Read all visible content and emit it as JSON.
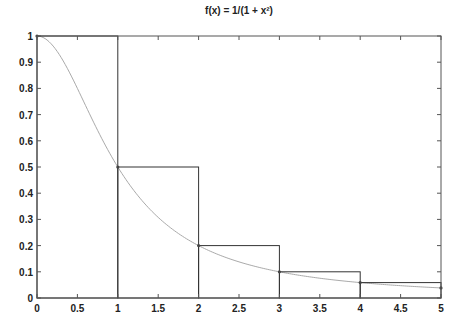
{
  "chart_data": {
    "type": "line",
    "title": "f(x) = 1/(1 + x²)",
    "xlabel": "",
    "ylabel": "",
    "xlim": [
      0,
      5
    ],
    "ylim": [
      0,
      1
    ],
    "grid": false,
    "legend": null,
    "x_ticks": [
      0,
      0.5,
      1,
      1.5,
      2,
      2.5,
      3,
      3.5,
      4,
      4.5,
      5
    ],
    "x_tick_labels": [
      "0",
      "0.5",
      "1",
      "1.5",
      "2",
      "2.5",
      "3",
      "3.5",
      "4",
      "4.5",
      "5"
    ],
    "y_ticks": [
      0,
      0.1,
      0.2,
      0.3,
      0.4,
      0.5,
      0.6,
      0.7,
      0.8,
      0.9,
      1
    ],
    "y_tick_labels": [
      "0",
      "0.1",
      "0.2",
      "0.3",
      "0.4",
      "0.5",
      "0.6",
      "0.7",
      "0.8",
      "0.9",
      "1"
    ],
    "series": [
      {
        "name": "f(x) curve",
        "kind": "line",
        "color": "#aaaaaa",
        "function": "1/(1+x^2)",
        "x_range": [
          0,
          5
        ]
      },
      {
        "name": "left-endpoint rectangles",
        "kind": "rectangles",
        "color": "#333333",
        "intervals": [
          [
            0,
            1
          ],
          [
            1,
            2
          ],
          [
            2,
            3
          ],
          [
            3,
            4
          ],
          [
            4,
            5
          ]
        ],
        "heights": [
          1.0,
          0.5,
          0.2,
          0.1,
          0.0588
        ]
      },
      {
        "name": "sample points",
        "kind": "scatter",
        "color": "#444444",
        "x": [
          0,
          1,
          2,
          3,
          4,
          5
        ],
        "y": [
          1.0,
          0.5,
          0.2,
          0.1,
          0.0588,
          0.0385
        ]
      }
    ]
  },
  "colors": {
    "axis": "#555555",
    "rect": "#333333",
    "curve": "#aaaaaa",
    "marker": "#444444"
  }
}
